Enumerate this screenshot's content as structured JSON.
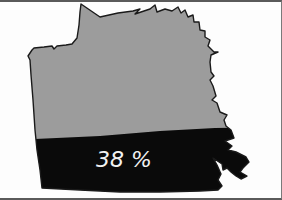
{
  "map": {
    "region_shape": "irregular-county-outline",
    "fill_percentage_label": "38 %",
    "fill_percentage_value": 38,
    "colors": {
      "background": "#fdfdfd",
      "unfilled": "#9c9c9c",
      "filled": "#0a0a0a",
      "outline": "#1a1a1a",
      "label_text": "#f2f2f2",
      "frame": "#5a5a5a"
    }
  }
}
